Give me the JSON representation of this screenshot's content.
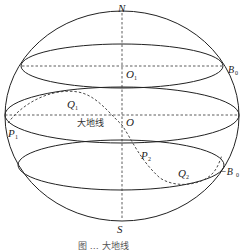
{
  "figure": {
    "type": "geodesic-on-sphere",
    "caption": "图 … 大地线",
    "colors": {
      "stroke": "#222222",
      "dashed": "#333333",
      "background": "#ffffff"
    },
    "labels": {
      "north": "N",
      "south": "S",
      "center": "O",
      "upper_center": "O",
      "upper_center_sub": "1",
      "b0": "B",
      "b0_sub": "0",
      "neg_b0_prefix": "−B",
      "neg_b0_sub": "0",
      "p1": "P",
      "p1_sub": "1",
      "p2": "P",
      "p2_sub": "2",
      "q1": "Q",
      "q1_sub": "1",
      "q2": "Q",
      "q2_sub": "2",
      "geodesic": "大地线"
    }
  }
}
